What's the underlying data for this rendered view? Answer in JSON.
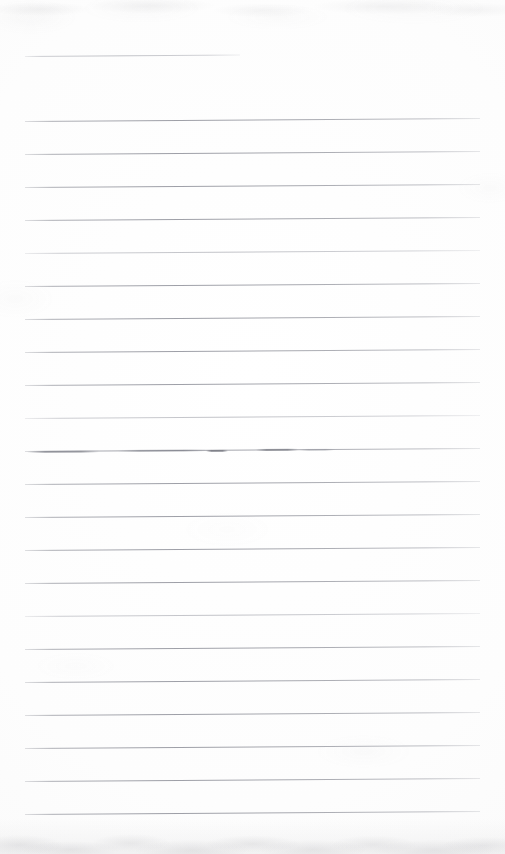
{
  "document": {
    "kind": "scanned-lined-notebook-page",
    "title": "Blank ruled notebook page",
    "visible_text": "",
    "page_width": 505,
    "page_height": 854,
    "background_color": "#fefefe",
    "rule_color": "#82848e",
    "rule_count": 24,
    "rule_spacing": 33,
    "rule_left_x": 25,
    "rule_right_x": 480,
    "rule_tilt_deg": -0.38,
    "notes": "No handwriting or printed text is present; the page is empty except for the printed ruled lines, a short top rule, a few faint dark smudges on one rule, and scanner grain."
  },
  "rules": [
    {
      "id": "rule-1",
      "y": 56,
      "x": 25,
      "width": 215,
      "weight": "faint",
      "short": true
    },
    {
      "id": "rule-2",
      "y": 121,
      "x": 25,
      "width": 455,
      "weight": "normal",
      "short": false
    },
    {
      "id": "rule-3",
      "y": 154,
      "x": 25,
      "width": 455,
      "weight": "normal",
      "short": false
    },
    {
      "id": "rule-4",
      "y": 187,
      "x": 25,
      "width": 455,
      "weight": "normal",
      "short": false
    },
    {
      "id": "rule-5",
      "y": 220,
      "x": 25,
      "width": 455,
      "weight": "normal",
      "short": false
    },
    {
      "id": "rule-6",
      "y": 253,
      "x": 25,
      "width": 455,
      "weight": "faint",
      "short": false
    },
    {
      "id": "rule-7",
      "y": 286,
      "x": 25,
      "width": 455,
      "weight": "normal",
      "short": false
    },
    {
      "id": "rule-8",
      "y": 319,
      "x": 25,
      "width": 455,
      "weight": "normal",
      "short": false
    },
    {
      "id": "rule-9",
      "y": 352,
      "x": 25,
      "width": 455,
      "weight": "normal",
      "short": false
    },
    {
      "id": "rule-10",
      "y": 385,
      "x": 25,
      "width": 455,
      "weight": "normal",
      "short": false
    },
    {
      "id": "rule-11",
      "y": 418,
      "x": 25,
      "width": 455,
      "weight": "faint",
      "short": false
    },
    {
      "id": "rule-12",
      "y": 451,
      "x": 25,
      "width": 455,
      "weight": "normal",
      "short": false
    },
    {
      "id": "rule-13",
      "y": 484,
      "x": 25,
      "width": 455,
      "weight": "normal",
      "short": false
    },
    {
      "id": "rule-14",
      "y": 517,
      "x": 25,
      "width": 455,
      "weight": "normal",
      "short": false
    },
    {
      "id": "rule-15",
      "y": 550,
      "x": 25,
      "width": 455,
      "weight": "normal",
      "short": false
    },
    {
      "id": "rule-16",
      "y": 583,
      "x": 25,
      "width": 455,
      "weight": "normal",
      "short": false
    },
    {
      "id": "rule-17",
      "y": 616,
      "x": 25,
      "width": 455,
      "weight": "faint",
      "short": false
    },
    {
      "id": "rule-18",
      "y": 649,
      "x": 25,
      "width": 455,
      "weight": "normal",
      "short": false
    },
    {
      "id": "rule-19",
      "y": 682,
      "x": 25,
      "width": 455,
      "weight": "normal",
      "short": false
    },
    {
      "id": "rule-20",
      "y": 715,
      "x": 25,
      "width": 455,
      "weight": "normal",
      "short": false
    },
    {
      "id": "rule-21",
      "y": 748,
      "x": 25,
      "width": 455,
      "weight": "normal",
      "short": false
    },
    {
      "id": "rule-22",
      "y": 781,
      "x": 25,
      "width": 455,
      "weight": "normal",
      "short": false
    },
    {
      "id": "rule-23",
      "y": 814,
      "x": 25,
      "width": 455,
      "weight": "normal",
      "short": false
    }
  ],
  "marks": [
    {
      "id": "mark-1",
      "y": 451,
      "x": 27,
      "width": 72,
      "color": "rgba(108,110,120,0.55)"
    },
    {
      "id": "mark-2",
      "y": 450,
      "x": 118,
      "width": 88,
      "color": "rgba(116,118,128,0.45)"
    },
    {
      "id": "mark-3",
      "y": 450,
      "x": 206,
      "width": 22,
      "color": "rgba(95,97,107,0.62)"
    },
    {
      "id": "mark-4",
      "y": 449,
      "x": 256,
      "width": 42,
      "color": "rgba(100,102,112,0.58)"
    },
    {
      "id": "mark-5",
      "y": 449,
      "x": 300,
      "width": 34,
      "color": "rgba(130,132,142,0.32)"
    }
  ]
}
